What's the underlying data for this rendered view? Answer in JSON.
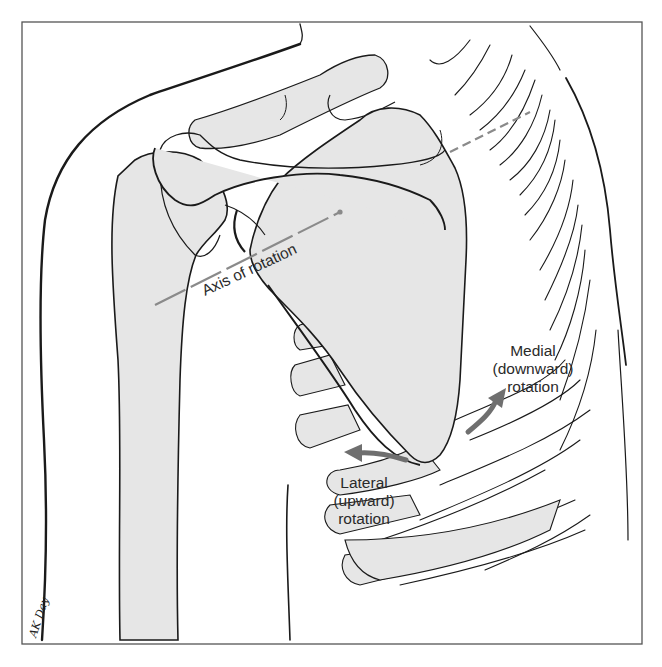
{
  "figure": {
    "labels": {
      "axis": "Axis of rotation",
      "medial_line1": "Medial",
      "medial_line2": "(downward)",
      "medial_line3": "rotation",
      "lateral_line1": "Lateral",
      "lateral_line2": "(upward)",
      "lateral_line3": "rotation"
    },
    "signature": "AK Day",
    "colors": {
      "bone_fill": "#e6e6e6",
      "outline": "#1a1a1a",
      "axis_line": "#8a8a8a",
      "arrow": "#6f6f6f",
      "frame": "#555555",
      "background": "#ffffff"
    }
  }
}
